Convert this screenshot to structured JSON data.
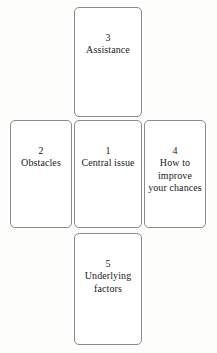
{
  "diagram": {
    "type": "tarot-five-card-cross-spread",
    "background_color": "#fdfdfb",
    "card_fill_color": "#ffffff",
    "card_border_color": "#8a8a8a",
    "text_color": "#1a1a1a",
    "positions": [
      {
        "number": "3",
        "label": "Assistance",
        "slot": "top"
      },
      {
        "number": "2",
        "label": "Obstacles",
        "slot": "left"
      },
      {
        "number": "1",
        "label": "Central issue",
        "slot": "center"
      },
      {
        "number": "4",
        "label": "How to improve your chances",
        "slot": "right"
      },
      {
        "number": "5",
        "label": "Underlying factors",
        "slot": "bottom"
      }
    ]
  }
}
